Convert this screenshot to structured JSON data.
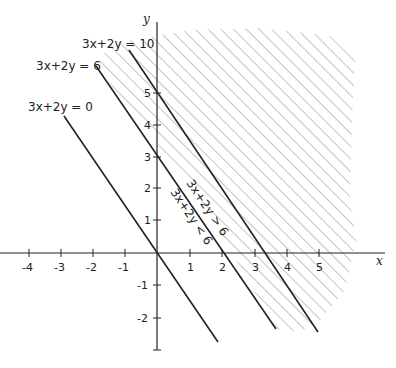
{
  "diagram": {
    "type": "linear-inequality-graph",
    "axes": {
      "x_label": "x",
      "y_label": "y",
      "x_ticks": [
        "-4",
        "-3",
        "-2",
        "-1",
        "1",
        "2",
        "3",
        "4",
        "5"
      ],
      "y_ticks": [
        "5",
        "4",
        "3",
        "2",
        "1",
        "-1",
        "-2"
      ]
    },
    "lines": [
      {
        "label": "3x+2y = 10"
      },
      {
        "label": "3x+2y = 6"
      },
      {
        "label": "3x+2y = 0"
      }
    ],
    "region_labels": {
      "above": "3x+2y > 6",
      "below": "3x+2y < 6"
    },
    "shaded_region": "3x+2y ≥ 6",
    "colors": {
      "line": "#222222",
      "hatch": "#8a8a8a"
    }
  }
}
